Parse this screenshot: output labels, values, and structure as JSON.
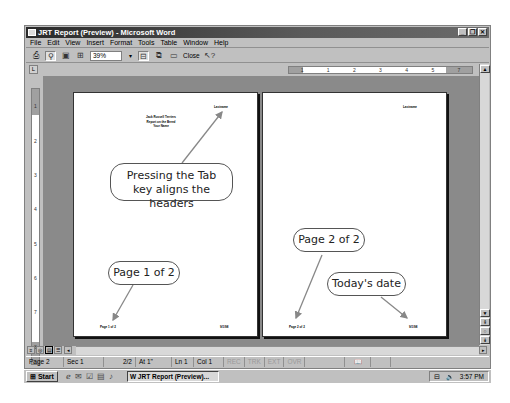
{
  "window": {
    "title": "JRT Report (Preview) - Microsoft Word",
    "controls": {
      "minimize": "_",
      "restore": "❐",
      "close": "✕"
    }
  },
  "menu": [
    "File",
    "Edit",
    "View",
    "Insert",
    "Format",
    "Tools",
    "Table",
    "Window",
    "Help"
  ],
  "toolbar": {
    "print_icon": "print-icon",
    "magnifier_icon": "magnifier-icon",
    "one_page_icon": "one-page-icon",
    "multiple_pages_icon": "multiple-pages-icon",
    "zoom_value": "39%",
    "view_ruler_icon": "view-ruler-icon",
    "shrink_to_fit_icon": "shrink-to-fit-icon",
    "full_screen_icon": "full-screen-icon",
    "close_label": "Close",
    "help_icon": "context-help-icon"
  },
  "ruler": {
    "tab_selector": "L",
    "horizontal_marks": [
      "1",
      "·",
      "1",
      "·",
      "2",
      "·",
      "3",
      "·",
      "4",
      "·",
      "5",
      "·",
      "7"
    ],
    "vertical_marks": [
      "1",
      "·",
      "1",
      "·",
      "2",
      "·",
      "3",
      "·",
      "4",
      "·",
      "5",
      "·",
      "6",
      "·",
      "7",
      "·",
      "8",
      "·"
    ]
  },
  "pages": [
    {
      "header_right": "Lastname",
      "title_lines": [
        "Jack Russell Terriers",
        "Report on the Breed",
        "Your Name"
      ],
      "footer_left": "Page 1 of 2",
      "footer_right": "9/1/98"
    },
    {
      "header_right": "Lastname",
      "footer_left": "Page 2 of 2",
      "footer_right": "9/1/98"
    }
  ],
  "callouts": {
    "tab_headers": [
      "Pressing the Tab",
      "key aligns the headers"
    ],
    "page1": "Page 1 of 2",
    "page2": "Page 2 of 2",
    "date": "Today's date"
  },
  "statusbar": {
    "page": "Page 2",
    "section": "Sec 1",
    "page_of": "2/2",
    "at": "At 1\"",
    "line": "Ln 1",
    "col": "Col 1",
    "rec": "REC",
    "trk": "TRK",
    "ext": "EXT",
    "ovr": "OVR"
  },
  "taskbar": {
    "start_label": "Start",
    "task_item": "JRT Report (Preview)...",
    "clock": "3:57 PM"
  }
}
